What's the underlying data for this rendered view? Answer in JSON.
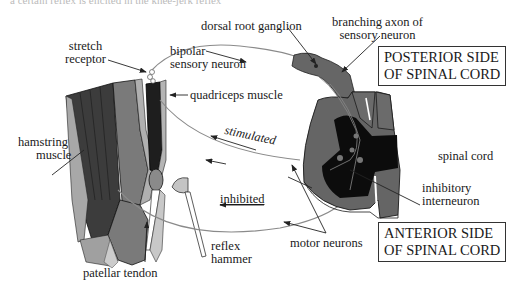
{
  "caption_fragment": "a certain reflex is elicited in the knee-jerk reflex",
  "labels": {
    "stretch_receptor": [
      "stretch",
      "receptor"
    ],
    "bipolar_sensory_neuron": [
      "bipolar",
      "sensory neuron"
    ],
    "dorsal_root_ganglion": "dorsal root ganglion",
    "branching_axon": [
      "branching axon of",
      "sensory neuron"
    ],
    "quadriceps_muscle": "quadriceps muscle",
    "hamstring_muscle": [
      "hamstring",
      "muscle"
    ],
    "stimulated": "stimulated",
    "inhibited": "inhibited",
    "spinal_cord": "spinal cord",
    "inhibitory_interneuron": [
      "inhibitory",
      "interneuron"
    ],
    "motor_neurons": "motor neurons",
    "reflex_hammer": [
      "reflex",
      "hammer"
    ],
    "patellar_tendon": "patellar tendon"
  },
  "boxes": {
    "posterior": [
      "POSTERIOR SIDE",
      "OF SPINAL CORD"
    ],
    "anterior": [
      "ANTERIOR SIDE",
      "OF SPINAL CORD"
    ]
  },
  "colors": {
    "muscle_dark": "#3a3a3a",
    "muscle_mid": "#6e6e6e",
    "bone_light": "#9a9a9a",
    "tissue_pale": "#c4c4c4",
    "cord_gray": "#666666",
    "cord_black": "#0c0c0c",
    "nerve_line": "#777777"
  }
}
